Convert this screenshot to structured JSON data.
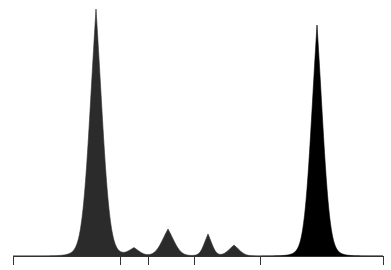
{
  "chart_data": {
    "type": "area",
    "title": "",
    "xlabel": "",
    "ylabel": "",
    "grid": false,
    "legend": null,
    "axis": {
      "x_pixel_range": [
        13,
        383
      ],
      "baseline_y": 256,
      "tick_x_pixels": [
        13,
        120,
        148,
        194,
        260,
        383
      ],
      "tick_labels": []
    },
    "series": [
      {
        "name": "trace-1",
        "color": "#2b2b2b",
        "peaks": [
          {
            "center": 96,
            "height": 247,
            "width": 7.5
          },
          {
            "center": 134,
            "height": 8,
            "width": 6
          },
          {
            "center": 168,
            "height": 27,
            "width": 7
          },
          {
            "center": 208,
            "height": 22,
            "width": 4.5
          },
          {
            "center": 234,
            "height": 11,
            "width": 6
          }
        ],
        "range": [
          13,
          262
        ]
      },
      {
        "name": "trace-2",
        "color": "#000000",
        "peaks": [
          {
            "center": 317,
            "height": 231,
            "width": 7
          }
        ],
        "range": [
          262,
          383
        ]
      }
    ]
  }
}
